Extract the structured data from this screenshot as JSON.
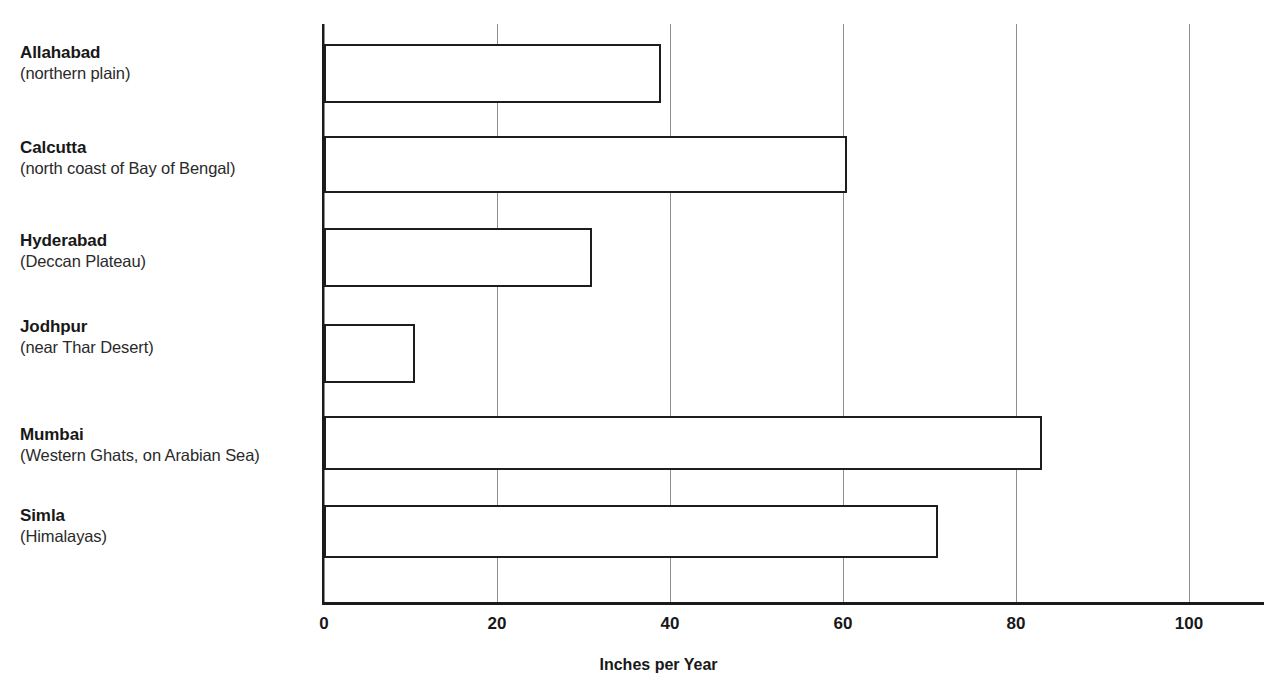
{
  "chart_data": {
    "type": "bar",
    "orientation": "horizontal",
    "title": "",
    "xlabel": "Inches per Year",
    "ylabel": "",
    "xlim": [
      0,
      106
    ],
    "xticks": [
      0,
      20,
      40,
      60,
      80,
      100
    ],
    "xtick_labels": [
      "0",
      "20",
      "40",
      "60",
      "80",
      "100"
    ],
    "grid": "vertical-only",
    "legend": "none",
    "bar_fill": "#ffffff",
    "bar_edge": "#1d1d1d",
    "categories": [
      "Allahabad (northern plain)",
      "Calcutta (north coast of Bay of Bengal)",
      "Hyderabad (Deccan Plateau)",
      "Jodhpur (near Thar Desert)",
      "Mumbai (Western Ghats, on Arabian Sea)",
      "Simla (Himalayas)"
    ],
    "values": [
      39,
      60.5,
      31,
      10.5,
      83,
      71
    ]
  },
  "categories": [
    {
      "name": "Allahabad",
      "sub": "(northern plain)",
      "value": 39
    },
    {
      "name": "Calcutta",
      "sub": "(north coast of Bay of Bengal)",
      "value": 60.5
    },
    {
      "name": "Hyderabad",
      "sub": "(Deccan Plateau)",
      "value": 31
    },
    {
      "name": "Jodhpur",
      "sub": "(near Thar Desert)",
      "value": 10.5
    },
    {
      "name": "Mumbai",
      "sub": "(Western Ghats, on Arabian Sea)",
      "value": 83
    },
    {
      "name": "Simla",
      "sub": "(Himalayas)",
      "value": 71
    }
  ],
  "axis": {
    "x_title": "Inches per Year",
    "ticks": [
      "0",
      "20",
      "40",
      "60",
      "80",
      "100"
    ]
  }
}
